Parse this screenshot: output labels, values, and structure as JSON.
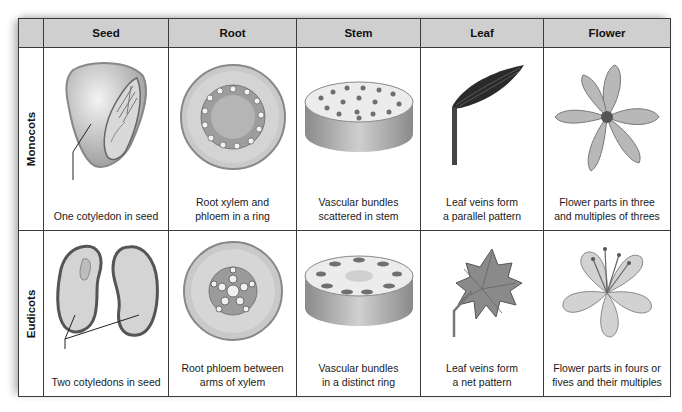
{
  "columns": [
    "",
    "Seed",
    "Root",
    "Stem",
    "Leaf",
    "Flower"
  ],
  "rows": [
    {
      "label": "Monocots",
      "cells": {
        "seed": {
          "caption": "One cotyledon in seed",
          "icon": "monocot-seed-icon"
        },
        "root": {
          "line1": "Root xylem and",
          "line2": "phloem in a ring",
          "icon": "monocot-root-cross-section-icon"
        },
        "stem": {
          "line1": "Vascular bundles",
          "line2": "scattered in stem",
          "icon": "monocot-stem-cross-section-icon"
        },
        "leaf": {
          "line1": "Leaf veins form",
          "line2": "a parallel pattern",
          "icon": "parallel-vein-leaf-icon"
        },
        "flower": {
          "line1": "Flower parts in three",
          "line2": "and multiples of threes",
          "icon": "lily-flower-icon"
        }
      }
    },
    {
      "label": "Eudicots",
      "cells": {
        "seed": {
          "caption": "Two cotyledons in seed",
          "icon": "eudicot-bean-seed-icon"
        },
        "root": {
          "line1": "Root phloem between",
          "line2": "arms of xylem",
          "icon": "eudicot-root-cross-section-icon"
        },
        "stem": {
          "line1": "Vascular bundles",
          "line2": "in a distinct ring",
          "icon": "eudicot-stem-cross-section-icon"
        },
        "leaf": {
          "line1": "Leaf veins form",
          "line2": "a net pattern",
          "icon": "net-vein-maple-leaf-icon"
        },
        "flower": {
          "line1": "Flower parts in fours or",
          "line2": "fives and their multiples",
          "icon": "five-petal-flower-icon"
        }
      }
    }
  ],
  "colors": {
    "header_bg": "#cfcfcf",
    "border": "#3a3a3a",
    "text": "#1a1a1a"
  }
}
